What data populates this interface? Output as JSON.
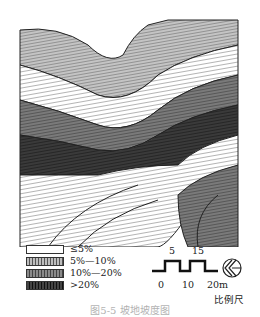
{
  "figure": {
    "caption": "图5-5 坡地坡度图"
  },
  "legend": {
    "items": [
      {
        "label": "≤5%",
        "fill": "#ffffff"
      },
      {
        "label": "5%—10%",
        "fill": "#bdbdbd"
      },
      {
        "label": "10%—20%",
        "fill": "#7a7a7a"
      },
      {
        "label": ">20%",
        "fill": "#333333"
      }
    ]
  },
  "scale_bar": {
    "top_ticks": [
      "5",
      "15"
    ],
    "bottom_ticks": [
      "0",
      "10",
      "20m"
    ],
    "label": "比例尺"
  },
  "north_arrow": {
    "icon": "north-arrow-icon"
  }
}
